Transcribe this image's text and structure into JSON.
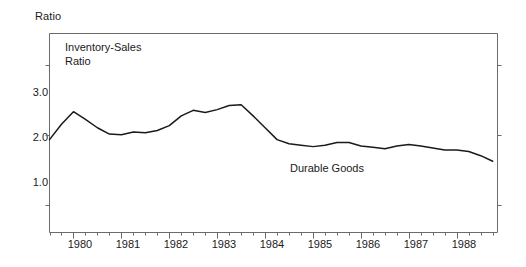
{
  "chart_data": {
    "type": "line",
    "title": "Inventory-Sales\nRatio",
    "axis_title_y": "Ratio",
    "xlabel": "",
    "ylabel": "Ratio",
    "ylim": [
      0.6,
      3.45
    ],
    "xlim": [
      1979.5,
      1988.85
    ],
    "grid": false,
    "legend_position": "inline-annotation",
    "yticks": [
      "3.0",
      "2.0",
      "1.0"
    ],
    "ytick_values": [
      3.0,
      2.0,
      1.0
    ],
    "xticks": [
      "1980",
      "1981",
      "1982",
      "1983",
      "1984",
      "1985",
      "1986",
      "1987",
      "1988"
    ],
    "xtick_values": [
      1980,
      1981,
      1982,
      1983,
      1984,
      1985,
      1986,
      1987,
      1988
    ],
    "minor_tick_interval_quarters": 1,
    "series": [
      {
        "name": "Durable Goods",
        "x": [
          1979.5,
          1979.75,
          1980.0,
          1980.25,
          1980.5,
          1980.75,
          1981.0,
          1981.25,
          1981.5,
          1981.75,
          1982.0,
          1982.25,
          1982.5,
          1982.75,
          1983.0,
          1983.25,
          1983.5,
          1983.75,
          1984.0,
          1984.25,
          1984.5,
          1984.75,
          1985.0,
          1985.25,
          1985.5,
          1985.75,
          1986.0,
          1986.25,
          1986.5,
          1986.75,
          1987.0,
          1987.25,
          1987.5,
          1987.75,
          1988.0,
          1988.25,
          1988.5,
          1988.75
        ],
        "values": [
          1.93,
          2.15,
          2.33,
          2.22,
          2.1,
          2.01,
          2.0,
          2.04,
          2.03,
          2.06,
          2.13,
          2.27,
          2.35,
          2.32,
          2.36,
          2.42,
          2.43,
          2.27,
          2.1,
          1.93,
          1.87,
          1.85,
          1.83,
          1.85,
          1.89,
          1.89,
          1.84,
          1.82,
          1.8,
          1.84,
          1.86,
          1.84,
          1.81,
          1.78,
          1.78,
          1.76,
          1.7,
          1.62
        ],
        "color": "#1a1a1a",
        "label_text": "Durable Goods"
      }
    ],
    "frame": {
      "color": "#6b6b6b",
      "sides": [
        "left",
        "right",
        "bottom",
        "top"
      ]
    }
  }
}
